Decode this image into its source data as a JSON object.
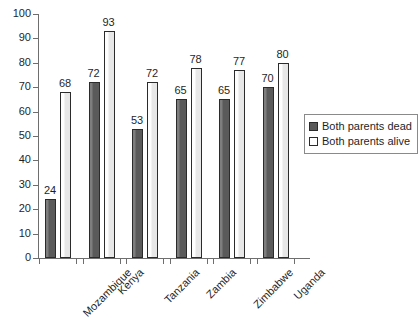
{
  "chart_data": {
    "type": "bar",
    "title": "",
    "subtitle": "",
    "xlabel": "",
    "ylabel": "",
    "ylim": [
      0,
      100
    ],
    "ytick_step": 10,
    "yticks": [
      "100",
      "90",
      "80",
      "70",
      "60",
      "50",
      "40",
      "30",
      "20",
      "10",
      "0"
    ],
    "grid": false,
    "legend_position": "right",
    "categories": [
      "Mozambique",
      "Kenya",
      "Tanzania",
      "Zambia",
      "Zimbabwe",
      "Uganda"
    ],
    "series": [
      {
        "name": "Both parents dead",
        "color": "#5a5a5a",
        "values": [
          24,
          72,
          53,
          65,
          65,
          70
        ]
      },
      {
        "name": "Both parents alive",
        "color": "#ffffff",
        "values": [
          68,
          93,
          72,
          78,
          77,
          80
        ]
      }
    ],
    "data_labels": {
      "Mozambique": {
        "dead": "24",
        "alive": "68"
      },
      "Kenya": {
        "dead": "72",
        "alive": "93"
      },
      "Tanzania": {
        "dead": "53",
        "alive": "72"
      },
      "Zambia": {
        "dead": "65",
        "alive": "78"
      },
      "Zimbabwe": {
        "dead": "65",
        "alive": "77"
      },
      "Uganda": {
        "dead": "70",
        "alive": "80"
      }
    }
  },
  "legend": {
    "items": [
      {
        "label": "Both parents dead",
        "swatch": "dead"
      },
      {
        "label": "Both parents alive",
        "swatch": "alive"
      }
    ]
  }
}
